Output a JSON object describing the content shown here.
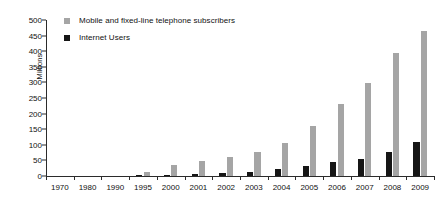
{
  "chart_data": {
    "type": "bar",
    "title": "",
    "subtitle": "",
    "xlabel": "",
    "ylabel": "Millions",
    "ylim": [
      0,
      500
    ],
    "ytick_step": 50,
    "yticks": [
      0,
      50,
      100,
      150,
      200,
      250,
      300,
      350,
      400,
      450,
      500
    ],
    "grid": false,
    "legend_position": "top-left",
    "categories": [
      "1970",
      "1980",
      "1990",
      "1995",
      "2000",
      "2001",
      "2002",
      "2003",
      "2004",
      "2005",
      "2006",
      "2007",
      "2008",
      "2009"
    ],
    "series": [
      {
        "name": "Mobile and fixed-line telephone subscribers",
        "color": "#a5a5a5",
        "values": [
          1,
          2,
          6,
          12,
          35,
          48,
          62,
          78,
          105,
          160,
          232,
          298,
          395,
          465
        ]
      },
      {
        "name": "Internet Users",
        "color": "#161616",
        "values": [
          0,
          0,
          0,
          1,
          4,
          6,
          10,
          14,
          22,
          32,
          44,
          56,
          77,
          110
        ]
      }
    ]
  },
  "legend": {
    "items": [
      {
        "label": "Mobile and fixed-line telephone subscribers",
        "marker": "square-gray"
      },
      {
        "label": "Internet Users",
        "marker": "square-black"
      }
    ]
  }
}
